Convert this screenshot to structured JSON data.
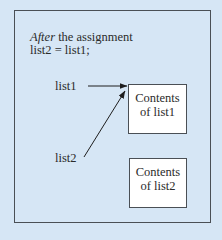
{
  "diagram": {
    "caption": {
      "italic_word": "After",
      "line1_rest": " the assignment",
      "line2": "list2 = list1;"
    },
    "variables": [
      {
        "id": "list1",
        "label": "list1"
      },
      {
        "id": "list2",
        "label": "list2"
      }
    ],
    "boxes": [
      {
        "id": "contents_list1",
        "line1": "Contents",
        "line2": "of list1"
      },
      {
        "id": "contents_list2",
        "line1": "Contents",
        "line2": "of list2"
      }
    ],
    "arrows": [
      {
        "from": "list1",
        "to": "contents_list1"
      },
      {
        "from": "list2",
        "to": "contents_list1"
      }
    ],
    "colors": {
      "background": "#d6e6f5",
      "box_fill": "#ffffff",
      "stroke": "#4a4f55",
      "text": "#2b2b2b"
    }
  }
}
